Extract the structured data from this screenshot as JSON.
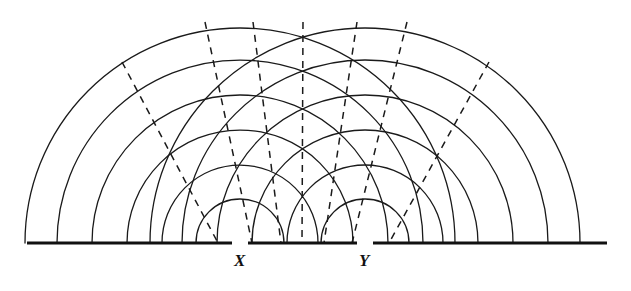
{
  "figure": {
    "kind": "wave-interference-diagram",
    "background_color": "#ffffff",
    "ink_color": "#1a1a1a",
    "canvas": {
      "width": 631,
      "height": 291
    },
    "baseline": {
      "name": "barrier-baseline",
      "y": 243,
      "x_start": 27,
      "x_end": 607,
      "stroke_width": 3.2,
      "gaps": [
        {
          "label": "X",
          "x_start": 232,
          "x_end": 248
        },
        {
          "label": "Y",
          "x_start": 357,
          "x_end": 373
        }
      ]
    },
    "sources": [
      {
        "id": "X",
        "label": "X",
        "x": 240,
        "y": 243,
        "label_x": 234,
        "label_y": 252
      },
      {
        "id": "Y",
        "label": "Y",
        "x": 365,
        "y": 243,
        "label_x": 359,
        "label_y": 252
      }
    ],
    "wavefronts": {
      "description": "Concentric semicircular wavefronts (crests) emanating from each slit",
      "radii": [
        44,
        78,
        113,
        148,
        183,
        215
      ],
      "wavelength": 34.5,
      "stroke_width": 1.3,
      "count_per_source": 6
    },
    "nodal_lines": {
      "description": "Dashed lines through the intersection points of the two wave families",
      "style": "dashed",
      "dash_pattern": "7 6",
      "stroke_width": 1.5,
      "pivot": {
        "x": 302,
        "y": 243
      },
      "lines": [
        {
          "id": "n-3",
          "top_x": 122,
          "top_y": 62,
          "bottom_x": 218,
          "bottom_y": 243
        },
        {
          "id": "n-2",
          "top_x": 205,
          "top_y": 22,
          "bottom_x": 252,
          "bottom_y": 243
        },
        {
          "id": "n-1",
          "top_x": 253,
          "top_y": 22,
          "bottom_x": 281,
          "bottom_y": 243
        },
        {
          "id": "n0",
          "top_x": 303,
          "top_y": 22,
          "bottom_x": 302,
          "bottom_y": 243
        },
        {
          "id": "n1",
          "top_x": 357,
          "top_y": 22,
          "bottom_x": 324,
          "bottom_y": 243
        },
        {
          "id": "n2",
          "top_x": 407,
          "top_y": 22,
          "bottom_x": 352,
          "bottom_y": 243
        },
        {
          "id": "n3",
          "top_x": 489,
          "top_y": 62,
          "bottom_x": 389,
          "bottom_y": 243
        }
      ]
    },
    "chart_data": {
      "type": "scatter",
      "title": "Two-source circular wavefront interference construction",
      "xlabel": "",
      "ylabel": "",
      "categories": [
        "X",
        "Y"
      ],
      "series": [
        {
          "name": "wavefronts-from-X",
          "values": [
            44,
            78,
            113,
            148,
            183,
            215
          ]
        },
        {
          "name": "wavefronts-from-Y",
          "values": [
            44,
            78,
            113,
            148,
            183,
            215
          ]
        }
      ]
    }
  }
}
